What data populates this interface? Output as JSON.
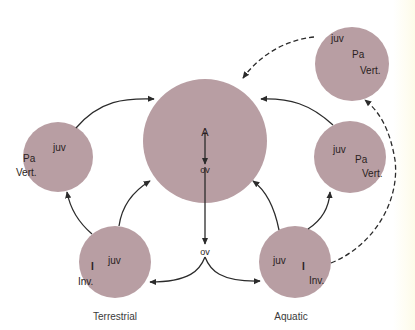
{
  "diagram": {
    "colors": {
      "circle_fill": "#b89ea3",
      "arrow": "#2b2b2b",
      "background": "#ffffff"
    },
    "central_node": {
      "top_label": "A",
      "bottom_label": "ov"
    },
    "egg_node": {
      "label": "ov"
    },
    "left_vert_node": {
      "labels": [
        "juv",
        "Pa",
        "Vert."
      ]
    },
    "right_vert_node": {
      "labels": [
        "juv",
        "Pa",
        "Vert."
      ]
    },
    "top_right_vert_node": {
      "labels": [
        "juv",
        "Pa",
        "Vert."
      ]
    },
    "terrestrial_node": {
      "labels": [
        "juv",
        "I",
        "Inv."
      ],
      "caption": "Terrestrial"
    },
    "aquatic_node": {
      "labels": [
        "juv",
        "I",
        "Inv."
      ],
      "caption": "Aquatic"
    }
  }
}
